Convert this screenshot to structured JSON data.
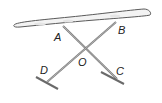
{
  "figure": {
    "labels": {
      "A": "A",
      "B": "B",
      "C": "C",
      "D": "D",
      "O": "O"
    },
    "colors": {
      "board_fill": "#f2f2f2",
      "board_stroke": "#5a5a5a",
      "leg_stroke": "#7a7a7a",
      "label": "#222222"
    },
    "segments": [
      "AC",
      "BD"
    ],
    "intersection": "O"
  }
}
